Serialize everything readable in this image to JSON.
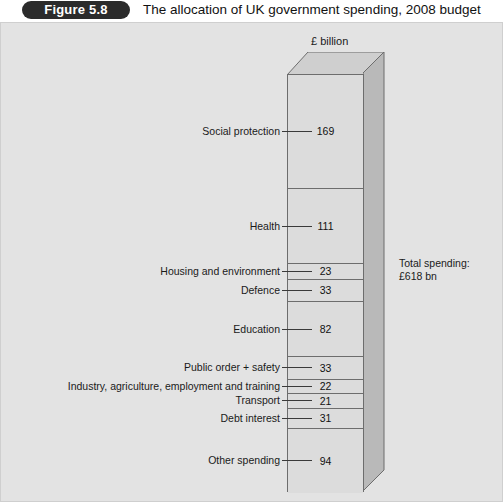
{
  "header": {
    "badge": "Figure 5.8",
    "title": "The allocation of UK government spending, 2008 budget"
  },
  "chart": {
    "units_label": "£ billion",
    "total_note_line1": "Total spending:",
    "total_note_line2": "£618 bn"
  },
  "chart_data": {
    "type": "bar",
    "title": "The allocation of UK government spending, 2008 budget",
    "subtitle": "£ billion",
    "xlabel": "",
    "ylabel": "£ billion",
    "stacked": true,
    "orientation": "vertical-single-stacked-column",
    "grid": false,
    "legend": "none",
    "total": 618,
    "total_label": "Total spending: £618 bn",
    "units": "£ billion",
    "categories": [
      "Social protection",
      "Health",
      "Housing and environment",
      "Defence",
      "Education",
      "Public order + safety",
      "Industry, agriculture, employment and training",
      "Transport",
      "Debt interest",
      "Other spending"
    ],
    "values": [
      169,
      111,
      23,
      33,
      82,
      33,
      22,
      21,
      31,
      94
    ],
    "segments": [
      {
        "label": "Social protection",
        "value": "169"
      },
      {
        "label": "Health",
        "value": "111"
      },
      {
        "label": "Housing and environment",
        "value": "23"
      },
      {
        "label": "Defence",
        "value": "33"
      },
      {
        "label": "Education",
        "value": "82"
      },
      {
        "label": "Public order + safety",
        "value": "33"
      },
      {
        "label": "Industry, agriculture, employment and training",
        "value": "22"
      },
      {
        "label": "Transport",
        "value": "21"
      },
      {
        "label": "Debt interest",
        "value": "31"
      },
      {
        "label": "Other spending",
        "value": "94"
      }
    ]
  },
  "colors": {
    "panel_background": "#e3e3e3",
    "bar_front": "#dcdcdc",
    "bar_side": "#b9b9b9",
    "bar_top": "#cfcfcf",
    "outline": "#6d6d6d",
    "badge_background": "#2b2b2b",
    "text": "#1a1a1a"
  }
}
